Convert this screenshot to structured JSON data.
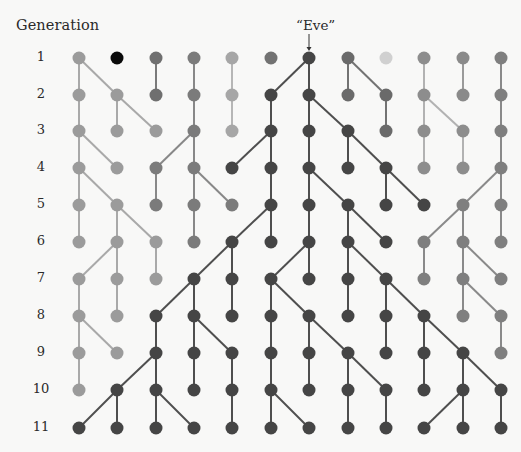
{
  "diagram": {
    "axis_title": "Generation",
    "annotation": {
      "label": "“Eve”",
      "column": 7,
      "generation": 1
    },
    "generations": [
      "1",
      "2",
      "3",
      "4",
      "5",
      "6",
      "7",
      "8",
      "9",
      "10",
      "11"
    ],
    "columns": 12,
    "column_x": [
      79,
      117,
      156,
      194,
      232,
      271,
      309,
      348,
      386,
      424,
      463,
      501
    ],
    "row_y": [
      58,
      95,
      131,
      168,
      205,
      242,
      279,
      316,
      353,
      390,
      428
    ],
    "node_radius": 6.5,
    "lineage_colors": {
      "1": {
        "node": "#9b9b9b",
        "edge": "#a9a9a9"
      },
      "2": {
        "node": "#0a0a0a",
        "edge": "#0a0a0a"
      },
      "3": {
        "node": "#6f6f6f",
        "edge": "#7a7a7a"
      },
      "4": {
        "node": "#7b7b7b",
        "edge": "#888888"
      },
      "5": {
        "node": "#a6a6a6",
        "edge": "#b6b6b6"
      },
      "6": {
        "node": "#727272",
        "edge": "#7c7c7c"
      },
      "7": {
        "node": "#454545",
        "edge": "#4f4f4f"
      },
      "8": {
        "node": "#6a6a6a",
        "edge": "#737373"
      },
      "9": {
        "node": "#d0d0d0",
        "edge": "#d0d0d0"
      },
      "10": {
        "node": "#8d8d8d",
        "edge": "#b2b2b2"
      },
      "11": {
        "node": "#8a8a8a",
        "edge": "#9a9a9a"
      },
      "12": {
        "node": "#7f7f7f",
        "edge": "#8a8a8a"
      }
    },
    "transitions": [
      [
        [
          1,
          1
        ],
        [
          1,
          2
        ],
        [
          3,
          3
        ],
        [
          4,
          4
        ],
        [
          5,
          5
        ],
        [
          7,
          6
        ],
        [
          7,
          7
        ],
        [
          8,
          8
        ],
        [
          8,
          9
        ],
        [
          10,
          10
        ],
        [
          11,
          11
        ],
        [
          12,
          12
        ]
      ],
      [
        [
          1,
          1
        ],
        [
          2,
          2
        ],
        [
          2,
          3
        ],
        [
          4,
          4
        ],
        [
          5,
          5
        ],
        [
          6,
          6
        ],
        [
          7,
          7
        ],
        [
          7,
          8
        ],
        [
          9,
          9
        ],
        [
          10,
          10
        ],
        [
          10,
          11
        ],
        [
          12,
          12
        ]
      ],
      [
        [
          1,
          1
        ],
        [
          1,
          2
        ],
        [
          4,
          3
        ],
        [
          4,
          4
        ],
        [
          6,
          5
        ],
        [
          6,
          6
        ],
        [
          7,
          7
        ],
        [
          8,
          8
        ],
        [
          8,
          9
        ],
        [
          10,
          10
        ],
        [
          11,
          11
        ],
        [
          12,
          12
        ]
      ],
      [
        [
          1,
          1
        ],
        [
          1,
          2
        ],
        [
          3,
          3
        ],
        [
          4,
          4
        ],
        [
          4,
          5
        ],
        [
          6,
          6
        ],
        [
          7,
          7
        ],
        [
          7,
          8
        ],
        [
          9,
          9
        ],
        [
          9,
          10
        ],
        [
          12,
          11
        ],
        [
          12,
          12
        ]
      ],
      [
        [
          1,
          1
        ],
        [
          2,
          2
        ],
        [
          2,
          3
        ],
        [
          4,
          4
        ],
        [
          6,
          5
        ],
        [
          6,
          6
        ],
        [
          7,
          7
        ],
        [
          8,
          8
        ],
        [
          8,
          9
        ],
        [
          11,
          10
        ],
        [
          11,
          11
        ],
        [
          12,
          12
        ]
      ],
      [
        [
          2,
          1
        ],
        [
          2,
          2
        ],
        [
          3,
          3
        ],
        [
          5,
          4
        ],
        [
          5,
          5
        ],
        [
          7,
          6
        ],
        [
          7,
          7
        ],
        [
          8,
          8
        ],
        [
          8,
          9
        ],
        [
          10,
          10
        ],
        [
          11,
          11
        ],
        [
          11,
          12
        ]
      ],
      [
        [
          1,
          1
        ],
        [
          2,
          2
        ],
        [
          4,
          3
        ],
        [
          4,
          4
        ],
        [
          5,
          5
        ],
        [
          6,
          6
        ],
        [
          6,
          7
        ],
        [
          8,
          8
        ],
        [
          9,
          9
        ],
        [
          9,
          10
        ],
        [
          11,
          11
        ],
        [
          11,
          12
        ]
      ],
      [
        [
          1,
          1
        ],
        [
          1,
          2
        ],
        [
          3,
          3
        ],
        [
          4,
          4
        ],
        [
          4,
          5
        ],
        [
          6,
          6
        ],
        [
          7,
          7
        ],
        [
          7,
          8
        ],
        [
          9,
          9
        ],
        [
          10,
          10
        ],
        [
          10,
          11
        ],
        [
          12,
          12
        ]
      ],
      [
        [
          1,
          1
        ],
        [
          3,
          2
        ],
        [
          3,
          3
        ],
        [
          4,
          4
        ],
        [
          5,
          5
        ],
        [
          6,
          6
        ],
        [
          7,
          7
        ],
        [
          8,
          8
        ],
        [
          8,
          9
        ],
        [
          10,
          10
        ],
        [
          11,
          11
        ],
        [
          11,
          12
        ]
      ],
      [
        [
          2,
          1
        ],
        [
          2,
          2
        ],
        [
          3,
          3
        ],
        [
          3,
          4
        ],
        [
          5,
          5
        ],
        [
          6,
          6
        ],
        [
          6,
          7
        ],
        [
          8,
          8
        ],
        [
          9,
          9
        ],
        [
          11,
          10
        ],
        [
          11,
          11
        ],
        [
          12,
          12
        ]
      ]
    ]
  },
  "chart_data": {
    "type": "diagram",
    "title": "Generation",
    "annotation": "“Eve”",
    "generations": [
      1,
      2,
      3,
      4,
      5,
      6,
      7,
      8,
      9,
      10,
      11
    ],
    "individuals_per_generation": 12
  }
}
